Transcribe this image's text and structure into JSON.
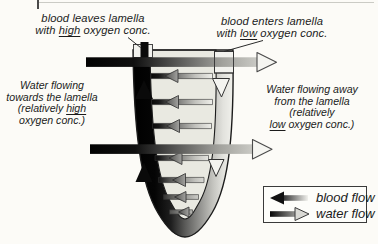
{
  "colors": {
    "background": "#fcfbf7",
    "ink": "#1b1b1b",
    "lamella_interior": "#e9e9e1",
    "outline": "#1c1c1c",
    "blood_dark": "#050505",
    "water_light": "#c9c9c4"
  },
  "labels": {
    "blood_leaves": {
      "line1": "blood leaves lamella",
      "line2_pre": "with ",
      "line2_underline": "high",
      "line2_post": " oxygen conc."
    },
    "blood_enters": {
      "line1": "blood enters lamella",
      "line2_pre": "with ",
      "line2_underline": "low",
      "line2_post": " oxygen conc."
    },
    "water_towards": {
      "line1": "Water flowing",
      "line2": "towards the lamella",
      "line3_pre": "(relatively ",
      "line3_underline": "high",
      "line4": "oxygen conc.)"
    },
    "water_away": {
      "line1": "Water flowing away",
      "line2": "from the lamella",
      "line3": "(relatively",
      "line4_underline": "low",
      "line4_post": " oxygen conc.)"
    }
  },
  "legend": {
    "blood_flow_label": "blood flow",
    "water_flow_label": "water flow"
  }
}
